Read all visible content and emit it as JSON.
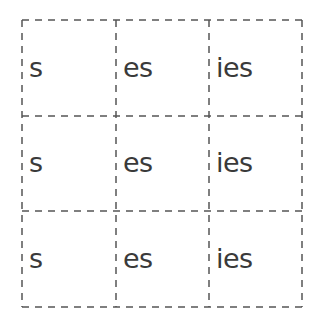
{
  "grid": {
    "rows": [
      [
        "s",
        "es",
        "ies"
      ],
      [
        "s",
        "es",
        "ies"
      ],
      [
        "s",
        "es",
        "ies"
      ]
    ],
    "line_color": "#555555",
    "text_color": "#3a3a3a"
  }
}
